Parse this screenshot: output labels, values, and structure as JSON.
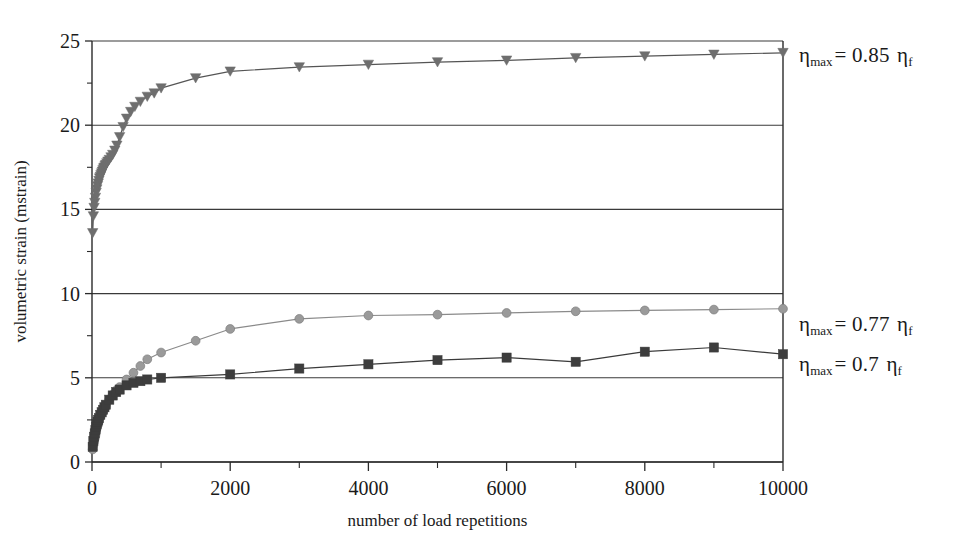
{
  "chart_data": {
    "type": "line",
    "title": "",
    "subtitle": "",
    "xlabel": "number of load repetitions",
    "ylabel": "volumetric strain (mstrain)",
    "xlim": [
      0,
      10000
    ],
    "ylim": [
      0,
      25
    ],
    "xticks": [
      0,
      2000,
      4000,
      6000,
      8000,
      10000
    ],
    "xtick_labels": [
      "0",
      "2000",
      "4000",
      "6000",
      "8000",
      "10000"
    ],
    "xminor_step": 1000,
    "yticks": [
      0,
      5,
      10,
      15,
      20,
      25
    ],
    "ytick_labels": [
      "0",
      "5",
      "10",
      "15",
      "20",
      "25"
    ],
    "yminor_step": 2.5,
    "grid": "horizontal",
    "legend_position": "right-inline-annotations",
    "series": [
      {
        "name": "eta_max = 0.85 eta_f",
        "marker": "triangle-down",
        "color": "#6e6e6e",
        "line_color": "#555555",
        "annotation": "ηmax = 0.85 ηf",
        "x": [
          10,
          20,
          30,
          40,
          50,
          60,
          70,
          80,
          90,
          100,
          110,
          120,
          130,
          140,
          150,
          160,
          170,
          180,
          190,
          200,
          215,
          230,
          250,
          275,
          300,
          330,
          360,
          400,
          450,
          500,
          560,
          620,
          700,
          800,
          900,
          1000,
          1500,
          2000,
          3000,
          4000,
          5000,
          6000,
          7000,
          8000,
          9000,
          10000
        ],
        "y": [
          13.6,
          14.6,
          15.1,
          15.4,
          15.7,
          16.0,
          16.2,
          16.4,
          16.55,
          16.7,
          16.85,
          16.95,
          17.05,
          17.15,
          17.25,
          17.35,
          17.45,
          17.5,
          17.6,
          17.65,
          17.75,
          17.85,
          17.95,
          18.1,
          18.25,
          18.5,
          18.8,
          19.3,
          19.9,
          20.4,
          20.8,
          21.1,
          21.4,
          21.7,
          21.9,
          22.2,
          22.8,
          23.2,
          23.45,
          23.6,
          23.75,
          23.85,
          24.0,
          24.1,
          24.2,
          24.3
        ]
      },
      {
        "name": "eta_max = 0.77 eta_f",
        "marker": "circle",
        "color": "#9a9a9a",
        "line_color": "#8a8a8a",
        "annotation": "ηmax = 0.77 ηf",
        "x": [
          10,
          20,
          30,
          40,
          50,
          60,
          70,
          80,
          90,
          100,
          120,
          140,
          160,
          180,
          200,
          250,
          300,
          350,
          400,
          500,
          600,
          700,
          800,
          1000,
          1500,
          2000,
          3000,
          4000,
          5000,
          6000,
          7000,
          8000,
          9000,
          10000
        ],
        "y": [
          0.75,
          1.0,
          1.2,
          1.4,
          1.6,
          1.8,
          2.0,
          2.2,
          2.35,
          2.5,
          2.7,
          2.9,
          3.05,
          3.2,
          3.35,
          3.7,
          4.0,
          4.25,
          4.45,
          4.9,
          5.3,
          5.7,
          6.1,
          6.5,
          7.2,
          7.9,
          8.5,
          8.7,
          8.75,
          8.85,
          8.95,
          9.0,
          9.05,
          9.1
        ]
      },
      {
        "name": "eta_max = 0.7 eta_f",
        "marker": "square",
        "color": "#3d3d3d",
        "line_color": "#3a3a3a",
        "annotation": "ηmax = 0.7 ηf",
        "x": [
          10,
          20,
          30,
          40,
          50,
          60,
          70,
          80,
          90,
          100,
          120,
          140,
          160,
          180,
          200,
          250,
          300,
          350,
          400,
          500,
          600,
          700,
          800,
          1000,
          2000,
          3000,
          4000,
          5000,
          6000,
          7000,
          8000,
          9000,
          10000
        ],
        "y": [
          0.9,
          1.25,
          1.5,
          1.7,
          1.9,
          2.1,
          2.25,
          2.4,
          2.5,
          2.6,
          2.8,
          2.95,
          3.1,
          3.25,
          3.4,
          3.7,
          3.95,
          4.15,
          4.3,
          4.55,
          4.7,
          4.8,
          4.9,
          5.0,
          5.2,
          5.55,
          5.8,
          6.05,
          6.2,
          5.95,
          6.55,
          6.8,
          6.4
        ]
      }
    ]
  },
  "annotations": {
    "series1": {
      "eta": "η",
      "sub_max": "max",
      "eq": "= 0.85",
      "eta2": "η",
      "sub_f": "f"
    },
    "series2": {
      "eta": "η",
      "sub_max": "max",
      "eq": "= 0.77",
      "eta2": "η",
      "sub_f": "f"
    },
    "series3": {
      "eta": "η",
      "sub_max": "max",
      "eq": "= 0.7",
      "eta2": "η",
      "sub_f": "f"
    }
  },
  "colors": {
    "axis": "#2a2a2a",
    "grid": "#3a3a3a",
    "background": "#ffffff",
    "series_085": "#6e6e6e",
    "series_077": "#9a9a9a",
    "series_07": "#3d3d3d"
  }
}
